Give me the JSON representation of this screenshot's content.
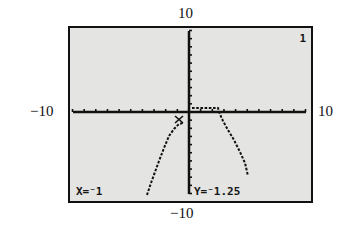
{
  "calculator": {
    "window": {
      "xmin": -10,
      "xmax": 10,
      "ymin": -10,
      "ymax": 10,
      "labels": {
        "top": "10",
        "bottom": "−10",
        "left": "−10",
        "right": "10"
      }
    },
    "plot_indicator": "1",
    "trace": {
      "x_readout": "X=⁻1",
      "y_readout": "Y=⁻1.25",
      "cursor_x": -1,
      "cursor_y": -1.25
    },
    "colors": {
      "screen_bg": "#e4e4e2",
      "ink": "#111111",
      "border": "#111111"
    }
  },
  "chart_data": {
    "type": "line",
    "title": "",
    "xlabel": "",
    "ylabel": "",
    "xlim": [
      -10,
      10
    ],
    "ylim": [
      -10,
      10
    ],
    "tick_labels": {
      "x": [
        "-10",
        "10"
      ],
      "y": [
        "-10",
        "10"
      ]
    },
    "grid": false,
    "series": [
      {
        "name": "left-branch",
        "x": [
          -3.6,
          -3.2,
          -2.8,
          -2.4,
          -2.0,
          -1.6,
          -1.3,
          -1.0
        ],
        "y": [
          -10.0,
          -8.6,
          -7.2,
          -5.8,
          -4.4,
          -3.1,
          -2.2,
          -1.5
        ]
      },
      {
        "name": "right-branch",
        "x": [
          0.1,
          1.0,
          2.0,
          2.6,
          3.0,
          3.5,
          4.0,
          4.5,
          5.0
        ],
        "y": [
          0.5,
          0.5,
          0.5,
          0.0,
          -1.0,
          -2.6,
          -4.3,
          -6.0,
          -7.8
        ]
      }
    ],
    "trace_point": {
      "x": -1,
      "y": -1.25
    }
  }
}
